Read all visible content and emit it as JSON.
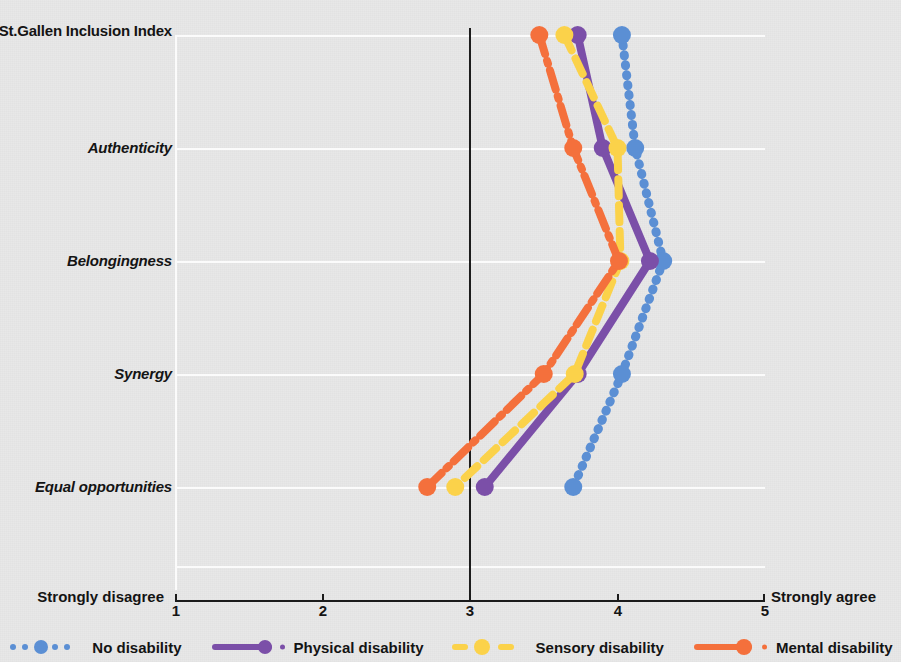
{
  "chart_data": {
    "type": "line",
    "title": "",
    "subtitle": "",
    "xlabel": "",
    "ylabel": "",
    "orientation": "horizontal",
    "xlim": [
      1,
      5
    ],
    "xticks": [
      "1",
      "2",
      "3",
      "4",
      "5"
    ],
    "grid": true,
    "legend_position": "bottom",
    "scale_anchor_low": "Strongly disagree",
    "scale_anchor_high": "Strongly agree",
    "reference_line_x": 3,
    "categories": [
      "St.Gallen Inclusion Index",
      "Authenticity",
      "Belongingness",
      "Synergy",
      "Equal opportunities"
    ],
    "category_styles": [
      "bold",
      "bold-italic",
      "bold-italic",
      "bold-italic",
      "bold-italic"
    ],
    "series": [
      {
        "name": "No disability",
        "color": "#5B8FD4",
        "style": "dotted",
        "values": [
          4.03,
          4.12,
          4.31,
          4.03,
          3.7
        ]
      },
      {
        "name": "Physical disability",
        "color": "#7B4FA8",
        "style": "solid",
        "values": [
          3.73,
          3.9,
          4.22,
          3.73,
          3.1
        ]
      },
      {
        "name": "Sensory disability",
        "color": "#FBD24A",
        "style": "dashed",
        "values": [
          3.64,
          4.0,
          4.02,
          3.71,
          2.9
        ]
      },
      {
        "name": "Mental disability",
        "color": "#F4703C",
        "style": "dash-dot",
        "values": [
          3.47,
          3.7,
          4.01,
          3.5,
          2.71
        ]
      }
    ]
  },
  "legend": {
    "items": [
      {
        "label": "No disability",
        "color": "#5B8FD4",
        "style": "dotted"
      },
      {
        "label": "Physical disability",
        "color": "#7B4FA8",
        "style": "solid"
      },
      {
        "label": "Sensory disability",
        "color": "#FBD24A",
        "style": "dashed"
      },
      {
        "label": "Mental disability",
        "color": "#F4703C",
        "style": "dash-dot"
      }
    ]
  },
  "axis": {
    "low_anchor": "Strongly disagree",
    "high_anchor": "Strongly agree",
    "ticks": [
      "1",
      "2",
      "3",
      "4",
      "5"
    ]
  },
  "colors": {
    "no_disability": "#5B8FD4",
    "physical_disability": "#7B4FA8",
    "sensory_disability": "#FBD24A",
    "mental_disability": "#F4703C",
    "reference_line": "#1d1d1d",
    "grid": "#fbfbfb",
    "background": "#e8e8e8"
  }
}
